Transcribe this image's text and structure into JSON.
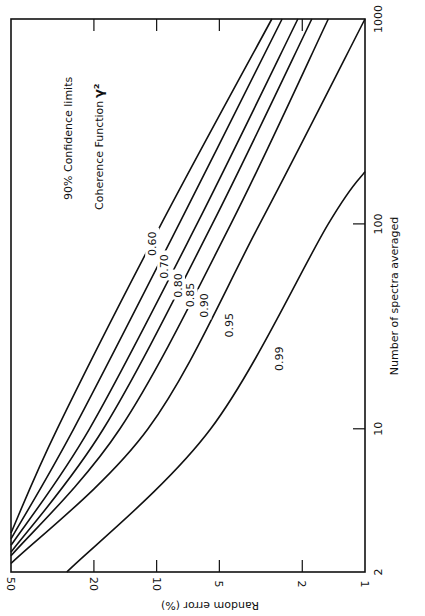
{
  "chart_data": {
    "type": "line",
    "orientation": "rotated 90° clockwise (x-axis along right edge, y-axis along bottom edge)",
    "title": "",
    "annotations": [
      "90% Confidence limits",
      "Coherence Function γ²"
    ],
    "xlabel": "Number of spectra averaged",
    "ylabel": "Random error (%)",
    "xscale": "log",
    "yscale": "log",
    "xlim": [
      2,
      1000
    ],
    "ylim": [
      1,
      50
    ],
    "xticks": [
      "2",
      "10",
      "100",
      "1000"
    ],
    "yticks": [
      "1",
      "2",
      "5",
      "10",
      "20",
      "50"
    ],
    "grid": false,
    "legend": "inline curve labels",
    "series": [
      {
        "name": "0.60",
        "x": [
          3.1,
          10,
          100,
          1000
        ],
        "y": [
          50,
          30,
          9.5,
          2.8
        ]
      },
      {
        "name": "0.70",
        "x": [
          2.9,
          10,
          100,
          1000
        ],
        "y": [
          50,
          25,
          7.8,
          2.5
        ]
      },
      {
        "name": "0.80",
        "x": [
          2.7,
          10,
          100,
          1000
        ],
        "y": [
          50,
          21,
          6.4,
          2.1
        ]
      },
      {
        "name": "0.85",
        "x": [
          2.5,
          10,
          100,
          1000
        ],
        "y": [
          50,
          18,
          5.4,
          1.8
        ]
      },
      {
        "name": "0.90",
        "x": [
          2.4,
          10,
          100,
          1000
        ],
        "y": [
          50,
          15,
          4.4,
          1.5
        ]
      },
      {
        "name": "0.95",
        "x": [
          2.2,
          10,
          100,
          1000
        ],
        "y": [
          50,
          11,
          3.2,
          1.0
        ]
      },
      {
        "name": "0.99",
        "x": [
          2,
          10,
          100,
          180
        ],
        "y": [
          27,
          5.5,
          1.5,
          1.0
        ]
      }
    ]
  },
  "axes": {
    "n_ticks": [
      {
        "label": "2",
        "v": 2
      },
      {
        "label": "10",
        "v": 10
      },
      {
        "label": "100",
        "v": 100
      },
      {
        "label": "1000",
        "v": 1000
      }
    ],
    "err_ticks": [
      {
        "label": "50",
        "v": 50
      },
      {
        "label": "20",
        "v": 20
      },
      {
        "label": "10",
        "v": 10
      },
      {
        "label": "5",
        "v": 5
      },
      {
        "label": "2",
        "v": 2
      },
      {
        "label": "1",
        "v": 1
      }
    ],
    "n_label": "Number of spectra averaged",
    "err_label": "Random error (%)"
  },
  "text": {
    "confidence": "90% Confidence limits",
    "coherence": "Coherence Function",
    "gamma": "γ²"
  },
  "curve_labels": [
    {
      "text": "0.60",
      "n": 80,
      "e": 10.5
    },
    {
      "text": "0.70",
      "n": 62,
      "e": 9.2
    },
    {
      "text": "0.80",
      "n": 50,
      "e": 7.9
    },
    {
      "text": "0.85",
      "n": 45,
      "e": 6.9
    },
    {
      "text": "0.90",
      "n": 40,
      "e": 5.9
    },
    {
      "text": "0.95",
      "n": 32,
      "e": 4.5
    },
    {
      "text": "0.99",
      "n": 22,
      "e": 2.6
    }
  ]
}
